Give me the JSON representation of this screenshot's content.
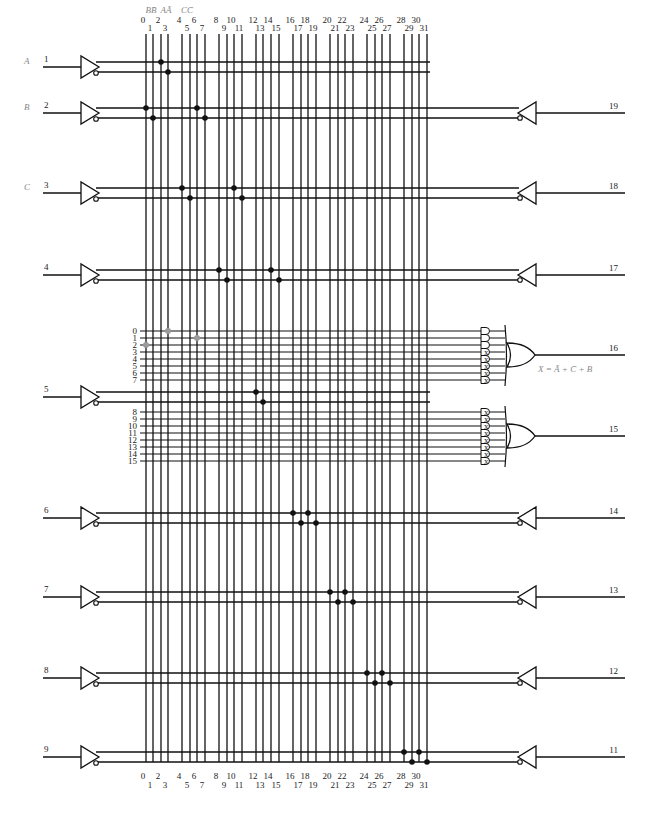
{
  "diagram": {
    "type": "PAL fuse map",
    "columns": {
      "count": 32,
      "x": [
        146,
        153,
        161,
        168,
        182,
        190,
        197,
        205,
        219,
        227,
        234,
        242,
        256,
        263,
        271,
        279,
        293,
        301,
        308,
        316,
        330,
        338,
        345,
        353,
        367,
        375,
        382,
        390,
        404,
        412,
        419,
        427
      ],
      "top_y": 34,
      "bottom_y": 762,
      "top_labels": [
        "0",
        "1",
        "2",
        "3",
        "4",
        "5",
        "6",
        "7",
        "8",
        "9",
        "10",
        "11",
        "12",
        "13",
        "14",
        "15",
        "16",
        "17",
        "18",
        "19",
        "20",
        "21",
        "22",
        "23",
        "24",
        "25",
        "26",
        "27",
        "28",
        "29",
        "30",
        "31"
      ],
      "bottom_labels": [
        "0",
        "1",
        "2",
        "3",
        "4",
        "5",
        "6",
        "7",
        "8",
        "9",
        "10",
        "11",
        "12",
        "13",
        "14",
        "15",
        "16",
        "17",
        "18",
        "19",
        "20",
        "21",
        "22",
        "23",
        "24",
        "25",
        "26",
        "27",
        "28",
        "29",
        "30",
        "31"
      ],
      "header_labels": [
        {
          "text": "BB̄",
          "x": 151
        },
        {
          "text": "AĀ",
          "x": 166
        },
        {
          "text": "CC̄",
          "x": 187
        }
      ]
    },
    "inputs": [
      {
        "pin": "1",
        "signal": "A",
        "y": 67,
        "dot_cols": [
          2,
          3
        ]
      },
      {
        "pin": "2",
        "signal": "B",
        "y": 113,
        "dot_cols": [
          0,
          1,
          6,
          7
        ]
      },
      {
        "pin": "3",
        "signal": "C",
        "y": 193,
        "dot_cols": [
          4,
          5,
          10,
          11
        ]
      },
      {
        "pin": "4",
        "signal": "",
        "y": 275,
        "dot_cols": [
          8,
          9,
          14,
          15
        ]
      },
      {
        "pin": "5",
        "signal": "",
        "y": 397,
        "dot_cols": [
          12,
          13
        ]
      },
      {
        "pin": "6",
        "signal": "",
        "y": 518,
        "dot_cols": [
          16,
          17,
          18,
          19
        ]
      },
      {
        "pin": "7",
        "signal": "",
        "y": 597,
        "dot_cols": [
          20,
          21,
          22,
          23
        ]
      },
      {
        "pin": "8",
        "signal": "",
        "y": 678,
        "dot_cols": [
          24,
          25,
          26,
          27
        ]
      },
      {
        "pin": "9",
        "signal": "",
        "y": 757,
        "dot_cols": [
          28,
          29,
          30,
          31
        ]
      }
    ],
    "feedback_outputs": [
      {
        "pin": "19",
        "y": 113,
        "dot_cols": [
          6,
          7
        ]
      },
      {
        "pin": "18",
        "y": 193,
        "dot_cols": [
          10,
          11
        ]
      },
      {
        "pin": "17",
        "y": 275,
        "dot_cols": [
          14,
          15
        ]
      },
      {
        "pin": "14",
        "y": 518,
        "dot_cols": [
          18,
          19
        ]
      },
      {
        "pin": "13",
        "y": 597,
        "dot_cols": [
          22,
          23
        ]
      },
      {
        "pin": "12",
        "y": 678,
        "dot_cols": [
          26,
          27
        ]
      },
      {
        "pin": "11",
        "y": 757,
        "dot_cols": [
          30,
          31
        ]
      }
    ],
    "product_groups": [
      {
        "output_pin": "16",
        "y": 355,
        "terms": [
          {
            "label": "0",
            "y": 331,
            "gate": "open",
            "fuses": [
              {
                "col": 3,
                "kind": "gray"
              }
            ]
          },
          {
            "label": "1",
            "y": 338,
            "gate": "open",
            "fuses": [
              {
                "col": 6,
                "kind": "gray"
              }
            ]
          },
          {
            "label": "2",
            "y": 345,
            "gate": "open",
            "fuses": [
              {
                "col": 0,
                "kind": "gray"
              }
            ]
          },
          {
            "label": "3",
            "y": 352,
            "gate": "x",
            "fuses": []
          },
          {
            "label": "4",
            "y": 359,
            "gate": "x",
            "fuses": []
          },
          {
            "label": "5",
            "y": 366,
            "gate": "x",
            "fuses": []
          },
          {
            "label": "6",
            "y": 373,
            "gate": "x",
            "fuses": []
          },
          {
            "label": "7",
            "y": 380,
            "gate": "x",
            "fuses": []
          }
        ],
        "equation": "X = Ā + C̄ + B"
      },
      {
        "output_pin": "15",
        "y": 436,
        "terms": [
          {
            "label": "8",
            "y": 412,
            "gate": "x",
            "fuses": []
          },
          {
            "label": "9",
            "y": 419,
            "gate": "x",
            "fuses": []
          },
          {
            "label": "10",
            "y": 426,
            "gate": "x",
            "fuses": []
          },
          {
            "label": "11",
            "y": 433,
            "gate": "x",
            "fuses": []
          },
          {
            "label": "12",
            "y": 440,
            "gate": "x",
            "fuses": []
          },
          {
            "label": "13",
            "y": 447,
            "gate": "x",
            "fuses": []
          },
          {
            "label": "14",
            "y": 454,
            "gate": "x",
            "fuses": []
          },
          {
            "label": "15",
            "y": 461,
            "gate": "x",
            "fuses": []
          }
        ],
        "equation": ""
      }
    ]
  },
  "text": {
    "equation": "X = Ā + C̄ + B",
    "signal_A": "A",
    "signal_B": "B",
    "signal_C": "C"
  }
}
